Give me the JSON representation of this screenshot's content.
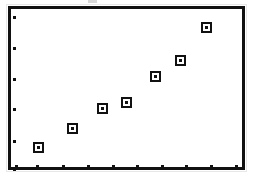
{
  "figure": {
    "background_color": "#ffffff",
    "frame_color": "#111111",
    "marker_color": "#111111",
    "marker_fill": "#ffffff",
    "frame": {
      "left": 8,
      "top": 6,
      "width": 237,
      "height": 164,
      "border_width": 3
    }
  },
  "chart_data": {
    "type": "scatter",
    "title": "",
    "subtitle": "",
    "xlabel": "",
    "ylabel": "",
    "grid": false,
    "legend": null,
    "legend_position": "none",
    "annotations": [],
    "xlim": [
      0,
      10
    ],
    "ylim": [
      0,
      10
    ],
    "xticks": [
      1,
      2,
      3,
      4,
      5,
      6,
      7,
      8,
      9,
      10
    ],
    "yticks": [
      1,
      2,
      3,
      4,
      5,
      6
    ],
    "xticklabels": [
      "",
      "",
      "",
      "",
      "",
      "",
      "",
      "",
      "",
      ""
    ],
    "yticklabels": [
      "",
      "",
      "",
      "",
      "",
      ""
    ],
    "tick_marks_only": true,
    "series": [
      {
        "name": "series-1",
        "marker": "square-open-with-center-dot",
        "marker_size_px": 11,
        "x": [
          1.2,
          2.6,
          3.8,
          4.8,
          6.0,
          7.0,
          8.1
        ],
        "y": [
          1.3,
          2.5,
          3.7,
          4.1,
          5.7,
          6.7,
          8.7
        ],
        "points_px": [
          {
            "cx": 38,
            "cy": 147
          },
          {
            "cx": 72,
            "cy": 128
          },
          {
            "cx": 102,
            "cy": 108
          },
          {
            "cx": 126,
            "cy": 102
          },
          {
            "cx": 155,
            "cy": 76
          },
          {
            "cx": 180,
            "cy": 60
          },
          {
            "cx": 206,
            "cy": 27
          }
        ]
      }
    ],
    "y_tick_px": [
      16,
      47,
      78,
      108,
      140,
      168
    ],
    "x_tick_px": [
      15,
      36,
      62,
      87,
      112,
      136,
      161,
      185,
      210,
      235
    ],
    "point_count": 7,
    "trend": "increasing"
  }
}
